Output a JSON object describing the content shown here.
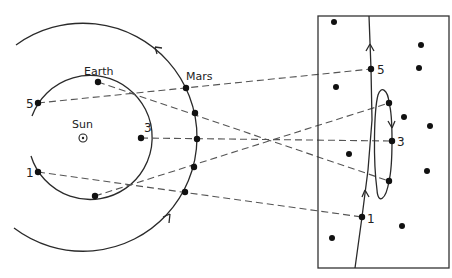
{
  "diagram": {
    "labels": {
      "sun": "Sun",
      "earth": "Earth",
      "mars": "Mars",
      "pos1": "1",
      "pos3": "3",
      "pos5": "5",
      "sky1": "1",
      "sky3": "3",
      "sky5": "5"
    },
    "colors": {
      "line": "#2a2a2a",
      "dashed": "#555555",
      "dot": "#111111",
      "background": "#ffffff"
    },
    "nodes": [
      {
        "id": "sun",
        "label": "Sun",
        "x": 83,
        "y": 138
      },
      {
        "id": "earth1",
        "label": "1",
        "x": 38,
        "y": 172
      },
      {
        "id": "earth2",
        "label": "",
        "x": 95,
        "y": 196
      },
      {
        "id": "earth3",
        "label": "3",
        "x": 141,
        "y": 138
      },
      {
        "id": "earth4",
        "label": "Earth",
        "x": 98,
        "y": 82
      },
      {
        "id": "earth5",
        "label": "5",
        "x": 38,
        "y": 103
      },
      {
        "id": "mars1",
        "x": 185,
        "y": 192
      },
      {
        "id": "mars2",
        "x": 194,
        "y": 167
      },
      {
        "id": "mars3",
        "x": 197,
        "y": 139
      },
      {
        "id": "mars4",
        "x": 195,
        "y": 113
      },
      {
        "id": "mars5",
        "x": 186,
        "y": 88
      },
      {
        "id": "sky1",
        "label": "1",
        "x": 362,
        "y": 217
      },
      {
        "id": "sky2",
        "x": 389,
        "y": 181
      },
      {
        "id": "sky3",
        "label": "3",
        "x": 392,
        "y": 141
      },
      {
        "id": "sky4",
        "x": 389,
        "y": 103
      },
      {
        "id": "sky5",
        "label": "5",
        "x": 371,
        "y": 69
      }
    ],
    "edges": [
      {
        "from": "earth1",
        "to": "sky1",
        "via": "mars1"
      },
      {
        "from": "earth2",
        "to": "sky4",
        "via": "mars2"
      },
      {
        "from": "earth3",
        "to": "sky3",
        "via": "mars3"
      },
      {
        "from": "earth4",
        "to": "sky2",
        "via": "mars4"
      },
      {
        "from": "earth5",
        "to": "sky5",
        "via": "mars5"
      }
    ],
    "background_stars": [
      [
        334,
        22
      ],
      [
        421,
        45
      ],
      [
        419,
        68
      ],
      [
        336,
        87
      ],
      [
        404,
        117
      ],
      [
        430,
        126
      ],
      [
        349,
        154
      ],
      [
        427,
        171
      ],
      [
        402,
        226
      ],
      [
        332,
        238
      ]
    ]
  }
}
